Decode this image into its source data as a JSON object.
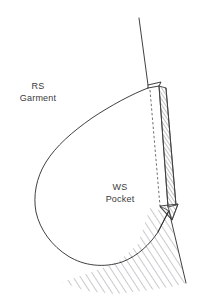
{
  "diagram": {
    "background_color": "#ffffff",
    "line_color": "#2a2a2a",
    "hatch_color": "#8f8f97",
    "labels": [
      {
        "id": "garment-label",
        "line1": "RS",
        "line2": "Garment",
        "x": 38,
        "y": 89,
        "meaning": "Right side of garment"
      },
      {
        "id": "pocket-label",
        "line1": "WS",
        "line2": "Pocket",
        "x": 120,
        "y": 190,
        "meaning": "Wrong side of pocket"
      }
    ],
    "regions": {
      "garment": {
        "name": "RS Garment",
        "fill": "diagonal-hatch",
        "hatch_angle_deg": 33
      },
      "pocket": {
        "name": "WS Pocket",
        "fill": "none"
      },
      "seam_allowance_strip": {
        "name": "folded seam allowance",
        "fill": "diagonal-hatch"
      },
      "corner_triangle": {
        "name": "mitred corner triangle",
        "fill": "diagonal-hatch"
      }
    },
    "fold_line": {
      "name": "fold line",
      "style": "dashed"
    }
  }
}
